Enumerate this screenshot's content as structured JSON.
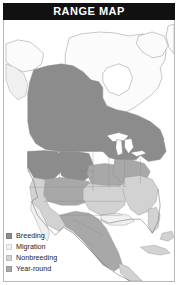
{
  "header": {
    "title": "RANGE MAP"
  },
  "map": {
    "region_name": "North America",
    "background_color": "#fdfdfd",
    "border_color": "#b9b9b9",
    "boundary_color": "#8f8f8f",
    "coast_color": "#6e6e6e",
    "water_color": "#ffffff",
    "labels": {
      "unmapped_land": "Unshaded land",
      "water": "Ocean and lakes"
    }
  },
  "legend": {
    "items": [
      {
        "label": "Breeding",
        "color": "#8c8c8c",
        "swatch_name": "breeding-swatch"
      },
      {
        "label": "Migration",
        "color": "#f0f0f0",
        "swatch_name": "migration-swatch"
      },
      {
        "label": "Nonbreeding",
        "color": "#d2d2d2",
        "swatch_name": "nonbreeding-swatch"
      },
      {
        "label": "Year-round",
        "color": "#a8a8a8",
        "swatch_name": "year-round-swatch"
      }
    ]
  },
  "shading": {
    "breeding": "#8c8c8c",
    "migration": "#f0f0f0",
    "nonbreeding": "#d2d2d2",
    "year_round": "#a8a8a8",
    "unmapped": "#fbfbfb"
  }
}
